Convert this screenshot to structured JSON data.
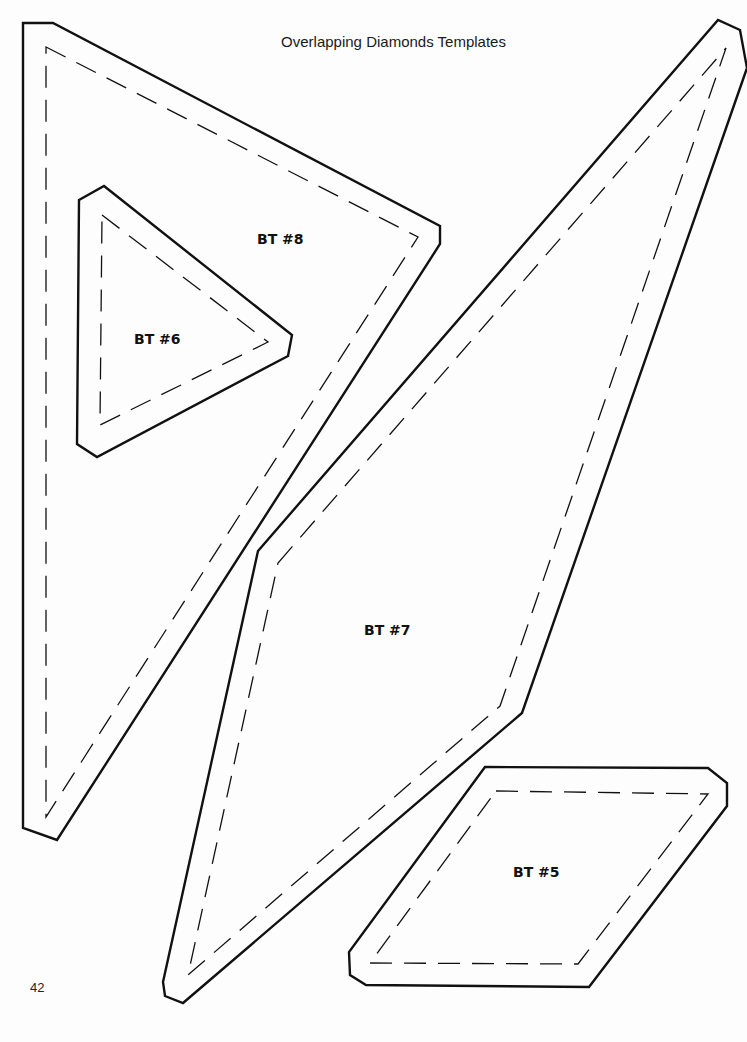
{
  "page": {
    "title": "Overlapping Diamonds Templates",
    "page_number": "42",
    "colors": {
      "line": "#111111",
      "background": "#ffffff"
    }
  },
  "templates": [
    {
      "id": "bt8",
      "label": "BT #8",
      "label_pos": [
        257,
        231
      ],
      "outer": "23,23 53,23 440,226 440,244 57,840 23,828",
      "inner": "46,47 418,237 46,817"
    },
    {
      "id": "bt6",
      "label": "BT #6",
      "label_pos": [
        134,
        331
      ],
      "outer": "79,200 104,186 292,335 288,356 97,457 77,444",
      "inner": "102,215 268,342 100,425"
    },
    {
      "id": "bt7",
      "label": "BT #7",
      "label_pos": [
        364,
        622
      ],
      "outer": "258,551 718,20 740,30 747,68 522,713 183,1003 165,996 163,982",
      "inner": "278,563 726,48 500,706 188,975"
    },
    {
      "id": "bt5",
      "label": "BT #5",
      "label_pos": [
        513,
        864
      ],
      "outer": "485,767 708,768 727,783 727,806 589,987 366,985 350,975 349,952",
      "inner": "496,791 708,794 578,964 370,963"
    }
  ]
}
